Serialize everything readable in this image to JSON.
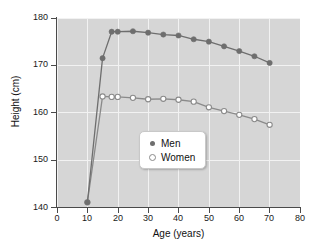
{
  "chart_data": {
    "type": "line",
    "title": "",
    "xlabel": "Age (years)",
    "ylabel": "Height (cm)",
    "xlim": [
      0,
      80
    ],
    "ylim": [
      140,
      180
    ],
    "xticks": [
      0,
      10,
      20,
      30,
      40,
      50,
      60,
      70,
      80
    ],
    "yticks": [
      140,
      150,
      160,
      170,
      180
    ],
    "grid": true,
    "legend_position": "center",
    "series": [
      {
        "name": "Men",
        "marker": "filled-circle",
        "color": "#6e6e6e",
        "x": [
          10,
          15,
          18,
          20,
          25,
          30,
          35,
          40,
          45,
          50,
          55,
          60,
          65,
          70
        ],
        "y": [
          141.0,
          171.5,
          177.1,
          177.1,
          177.2,
          176.9,
          176.5,
          176.3,
          175.5,
          175.0,
          174.0,
          173.0,
          171.9,
          170.5
        ]
      },
      {
        "name": "Women",
        "marker": "open-circle",
        "color": "#8a8a8a",
        "x": [
          10,
          15,
          18,
          20,
          25,
          30,
          35,
          40,
          45,
          50,
          55,
          60,
          65,
          70
        ],
        "y": [
          141.0,
          163.4,
          163.3,
          163.3,
          163.1,
          162.8,
          162.9,
          162.7,
          162.3,
          161.1,
          160.3,
          159.5,
          158.6,
          157.4
        ]
      }
    ]
  },
  "axes": {
    "ylabel": "Height (cm)",
    "xlabel": "Age (years)",
    "ytick_labels": [
      "180",
      "170",
      "160",
      "150",
      "140"
    ],
    "xtick_labels": [
      "0",
      "10",
      "20",
      "30",
      "40",
      "50",
      "60",
      "70",
      "80"
    ]
  },
  "legend": {
    "items": [
      {
        "label": "Men",
        "marker": "filled-circle"
      },
      {
        "label": "Women",
        "marker": "open-circle"
      }
    ]
  },
  "colors": {
    "plot_background": "#d6d6d6",
    "gridline": "#f2f2f2",
    "axis": "#4a4a4a",
    "men": "#6e6e6e",
    "women": "#8a8a8a",
    "page_background": "#ffffff"
  }
}
